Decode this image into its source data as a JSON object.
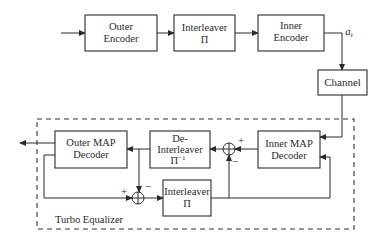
{
  "diagram": {
    "transmitter": {
      "blocks": [
        {
          "id": "outer-encoder",
          "line1": "Outer",
          "line2": "Encoder"
        },
        {
          "id": "interleaver",
          "line1": "Interleaver",
          "line2": "Π"
        },
        {
          "id": "inner-encoder",
          "line1": "Inner",
          "line2": "Encoder"
        }
      ],
      "output_label": "a",
      "output_label_sub": "t"
    },
    "channel": {
      "label": "Channel"
    },
    "receiver": {
      "group_label": "Turbo Equalizer",
      "blocks": [
        {
          "id": "outer-map-decoder",
          "line1": "Outer MAP",
          "line2": "Decoder"
        },
        {
          "id": "de-interleaver",
          "line1": "De-",
          "line2": "Interleaver",
          "line3": "Π",
          "line3_sup": "−1"
        },
        {
          "id": "inner-map-decoder",
          "line1": "Inner MAP",
          "line2": "Decoder"
        },
        {
          "id": "interleaver-2",
          "line1": "Interleaver",
          "line2": "Π"
        }
      ],
      "junctions": [
        {
          "id": "upper-sum",
          "plus": "+",
          "minus": "−"
        },
        {
          "id": "lower-sum",
          "plus": "+",
          "minus": "−"
        }
      ]
    }
  }
}
